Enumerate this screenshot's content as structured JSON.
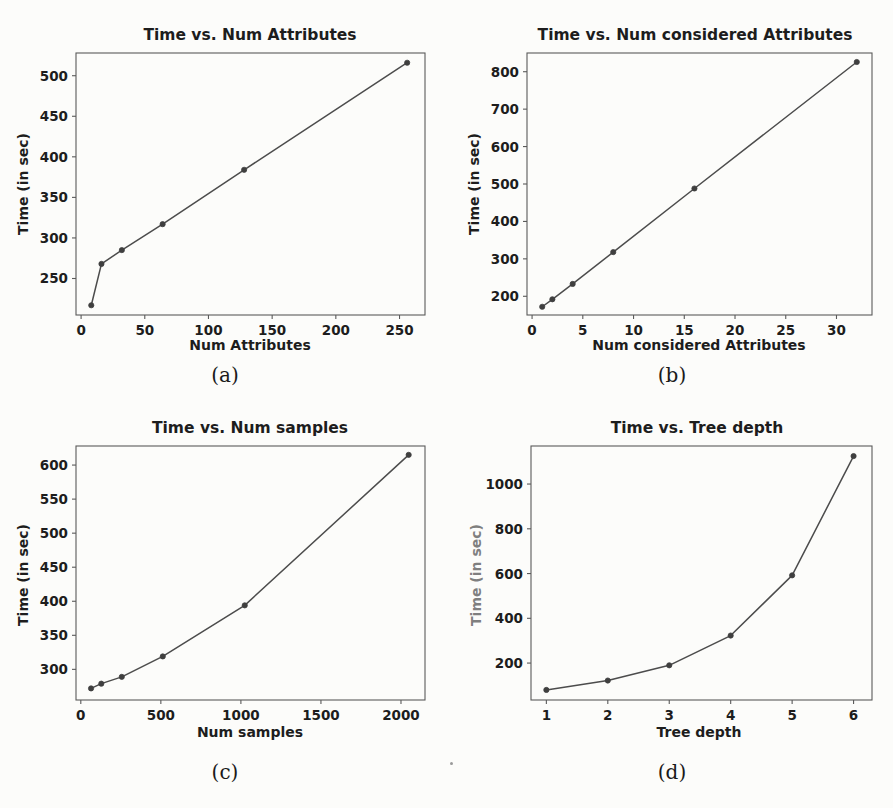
{
  "figure": {
    "background_color": "#fcfcfa",
    "line_color": "#4c4c4c",
    "marker_color": "#3f3f3f",
    "axis_color": "#5a5a5a",
    "text_color": "#1d1d1d",
    "subcaptions": {
      "a": "(a)",
      "b": "(b)",
      "c": "(c)",
      "d": "(d)"
    }
  },
  "chart_data": [
    {
      "id": "a",
      "type": "line",
      "title": "Time vs. Num Attributes",
      "xlabel": "Num Attributes",
      "ylabel": "Time (in sec)",
      "x": [
        8,
        16,
        32,
        64,
        128,
        256
      ],
      "values": [
        217,
        268,
        285,
        317,
        384,
        516
      ],
      "xticks": [
        0,
        50,
        100,
        150,
        200,
        250
      ],
      "yticks": [
        250,
        300,
        350,
        400,
        450,
        500
      ],
      "xlim": [
        -4,
        270
      ],
      "ylim": [
        205,
        528
      ],
      "grid": false,
      "legend": null
    },
    {
      "id": "b",
      "type": "line",
      "title": "Time vs. Num considered Attributes",
      "xlabel": "Num considered Attributes",
      "ylabel": "Time (in sec)",
      "x": [
        1,
        2,
        4,
        8,
        16,
        32
      ],
      "values": [
        172,
        192,
        233,
        318,
        488,
        826
      ],
      "xticks": [
        0,
        5,
        10,
        15,
        20,
        25,
        30
      ],
      "yticks": [
        200,
        300,
        400,
        500,
        600,
        700,
        800
      ],
      "xlim": [
        -0.5,
        33.5
      ],
      "ylim": [
        150,
        850
      ],
      "grid": false,
      "legend": null
    },
    {
      "id": "c",
      "type": "line",
      "title": "Time vs. Num samples",
      "xlabel": "Num samples",
      "ylabel": "Time (in sec)",
      "x": [
        64,
        128,
        256,
        512,
        1024,
        2048
      ],
      "values": [
        272,
        279,
        289,
        319,
        394,
        615
      ],
      "xticks": [
        0,
        500,
        1000,
        1500,
        2000
      ],
      "yticks": [
        300,
        350,
        400,
        450,
        500,
        550,
        600
      ],
      "xlim": [
        -30,
        2150
      ],
      "ylim": [
        255,
        628
      ],
      "grid": false,
      "legend": null
    },
    {
      "id": "d",
      "type": "line",
      "title": "Time vs. Tree depth",
      "xlabel": "Tree depth",
      "ylabel": "Time (in sec)",
      "x": [
        1,
        2,
        3,
        4,
        5,
        6
      ],
      "values": [
        80,
        122,
        190,
        323,
        592,
        1125
      ],
      "xticks": [
        1,
        2,
        3,
        4,
        5,
        6
      ],
      "yticks": [
        200,
        400,
        600,
        800,
        1000
      ],
      "xlim": [
        0.75,
        6.3
      ],
      "ylim": [
        35,
        1170
      ],
      "grid": false,
      "legend": null
    }
  ]
}
